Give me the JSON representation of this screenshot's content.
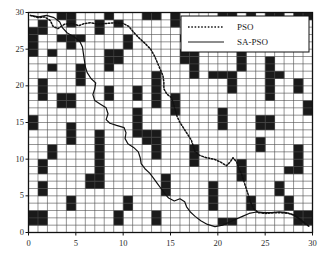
{
  "chart_data": {
    "type": "heatmap",
    "title": "",
    "xlabel": "",
    "ylabel": "",
    "xlim": [
      0,
      30
    ],
    "ylim": [
      0,
      30
    ],
    "grid": true,
    "x_ticks": [
      0,
      5,
      10,
      15,
      20,
      25,
      30
    ],
    "y_ticks": [
      0,
      5,
      10,
      15,
      20,
      25,
      30
    ],
    "x_tick_labels": [
      "0",
      "5",
      "10",
      "15",
      "20",
      "25",
      "30"
    ],
    "y_tick_labels": [
      "0",
      "5",
      "10",
      "15",
      "20",
      "25",
      "30"
    ],
    "grid_size": 30,
    "cell_free_color": "#ffffff",
    "cell_obstacle_color": "#1a1a1a",
    "grid_line_color": "#4d4d4d",
    "legend": {
      "position": "upper-right",
      "entries": [
        {
          "label": "PSO",
          "style": "dotted",
          "color": "#1a1a1a"
        },
        {
          "label": "SA-PSO",
          "style": "solid",
          "color": "#1a1a1a"
        }
      ]
    },
    "obstacle_rows": [
      "000110001000110100001101011011",
      "010010010100000100000000000000",
      "110000010000000000000000000110",
      "100111000010000010010011011000",
      "100010000010000000000000010000",
      "101000001100000011000010000000",
      "000000001100000011000010010000",
      "001001001000000001000010010000",
      "000001000000010001011100011000",
      "010001000000010000000100010010",
      "010000001001010000000100010010",
      "010110001001010100000000010000",
      "000110000000010100000000000001",
      "000000000001000100001000000001",
      "100000000001000000001000110000",
      "100010000001000000001000110000",
      "000010010001110000000000000000",
      "000010010000110000000000100000",
      "001000010000010001000000100010",
      "001000010000010001000000000010",
      "010000010000000001000010000010",
      "010000010000000000000010000110",
      "000000110000001000000010000000",
      "010000110000001000010000001000",
      "010000000000001000010000001000",
      "000010000010000000010001000100",
      "000010000010000000010001000100",
      "110000000100010000000000000011",
      "110000000100010000001100000011",
      "000000000000000000000000000000"
    ],
    "paths": {
      "pso": {
        "name": "PSO",
        "style": "dotted",
        "points": [
          [
            0.2,
            29.6
          ],
          [
            1.0,
            29.3
          ],
          [
            1.7,
            29.4
          ],
          [
            2.3,
            28.9
          ],
          [
            2.6,
            28.1
          ],
          [
            3.1,
            27.8
          ],
          [
            3.8,
            28.4
          ],
          [
            4.6,
            28.5
          ],
          [
            5.3,
            28.2
          ],
          [
            5.9,
            28.5
          ],
          [
            6.6,
            28.6
          ],
          [
            7.4,
            28.4
          ],
          [
            8.2,
            28.5
          ],
          [
            9.1,
            28.6
          ],
          [
            10.0,
            28.5
          ],
          [
            10.6,
            28.1
          ],
          [
            11.1,
            27.3
          ],
          [
            11.7,
            26.5
          ],
          [
            12.3,
            25.8
          ],
          [
            12.9,
            25.0
          ],
          [
            13.3,
            24.1
          ],
          [
            13.6,
            23.2
          ],
          [
            13.9,
            22.3
          ],
          [
            14.2,
            21.4
          ],
          [
            14.3,
            20.5
          ],
          [
            14.3,
            19.6
          ],
          [
            14.6,
            18.9
          ],
          [
            15.1,
            18.4
          ],
          [
            15.3,
            17.6
          ],
          [
            15.5,
            16.7
          ],
          [
            15.7,
            15.8
          ],
          [
            16.0,
            15.0
          ],
          [
            16.4,
            14.2
          ],
          [
            16.8,
            13.4
          ],
          [
            17.2,
            12.6
          ],
          [
            17.4,
            11.8
          ],
          [
            17.6,
            11.0
          ],
          [
            18.1,
            10.5
          ],
          [
            18.8,
            10.2
          ],
          [
            19.6,
            10.0
          ],
          [
            20.3,
            9.6
          ],
          [
            20.9,
            9.1
          ],
          [
            21.3,
            9.6
          ],
          [
            21.6,
            10.2
          ],
          [
            22.0,
            9.6
          ],
          [
            22.2,
            8.8
          ],
          [
            22.5,
            8.0
          ],
          [
            22.7,
            7.2
          ],
          [
            22.9,
            6.4
          ],
          [
            23.1,
            5.6
          ],
          [
            23.3,
            4.8
          ],
          [
            23.5,
            4.0
          ],
          [
            23.8,
            3.2
          ],
          [
            24.3,
            2.7
          ],
          [
            25.1,
            2.6
          ],
          [
            25.9,
            2.7
          ],
          [
            26.7,
            2.7
          ],
          [
            27.5,
            2.6
          ],
          [
            28.2,
            2.3
          ],
          [
            28.7,
            1.7
          ],
          [
            29.2,
            1.2
          ],
          [
            29.7,
            0.8
          ]
        ]
      },
      "sa_pso": {
        "name": "SA-PSO",
        "style": "solid",
        "points": [
          [
            0.2,
            29.6
          ],
          [
            1.1,
            29.4
          ],
          [
            1.9,
            29.6
          ],
          [
            2.7,
            29.3
          ],
          [
            3.3,
            28.7
          ],
          [
            3.6,
            27.9
          ],
          [
            4.1,
            27.2
          ],
          [
            4.8,
            26.7
          ],
          [
            5.4,
            26.1
          ],
          [
            5.7,
            25.3
          ],
          [
            5.8,
            24.4
          ],
          [
            5.9,
            23.5
          ],
          [
            6.0,
            22.6
          ],
          [
            6.2,
            21.8
          ],
          [
            6.6,
            21.0
          ],
          [
            7.1,
            20.4
          ],
          [
            7.0,
            19.6
          ],
          [
            6.8,
            18.8
          ],
          [
            7.0,
            18.0
          ],
          [
            7.6,
            17.5
          ],
          [
            8.2,
            17.0
          ],
          [
            8.4,
            16.2
          ],
          [
            8.2,
            15.4
          ],
          [
            8.6,
            14.9
          ],
          [
            9.3,
            14.6
          ],
          [
            10.1,
            14.3
          ],
          [
            10.3,
            13.6
          ],
          [
            10.2,
            12.8
          ],
          [
            10.5,
            12.1
          ],
          [
            11.1,
            11.6
          ],
          [
            11.6,
            11.0
          ],
          [
            11.8,
            10.2
          ],
          [
            11.9,
            9.4
          ],
          [
            12.3,
            8.7
          ],
          [
            12.8,
            8.1
          ],
          [
            13.2,
            7.4
          ],
          [
            13.6,
            6.7
          ],
          [
            14.0,
            6.0
          ],
          [
            14.4,
            5.3
          ],
          [
            14.8,
            4.7
          ],
          [
            15.4,
            4.3
          ],
          [
            16.0,
            4.6
          ],
          [
            16.5,
            4.2
          ],
          [
            16.7,
            3.5
          ],
          [
            17.1,
            2.8
          ],
          [
            17.6,
            2.2
          ],
          [
            18.2,
            1.6
          ],
          [
            18.9,
            1.1
          ],
          [
            19.7,
            0.8
          ],
          [
            20.5,
            1.0
          ],
          [
            21.2,
            1.4
          ],
          [
            21.9,
            1.8
          ],
          [
            22.6,
            2.2
          ],
          [
            23.3,
            2.6
          ],
          [
            24.1,
            2.8
          ],
          [
            24.9,
            2.7
          ],
          [
            25.7,
            2.7
          ],
          [
            26.5,
            2.8
          ],
          [
            27.3,
            2.7
          ],
          [
            28.0,
            2.4
          ],
          [
            28.6,
            1.9
          ],
          [
            29.1,
            1.4
          ],
          [
            29.6,
            0.9
          ]
        ]
      }
    }
  }
}
